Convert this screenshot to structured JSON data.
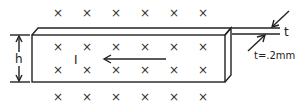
{
  "diagram": {
    "field_symbol": "×",
    "field_grid": {
      "rows": 4,
      "cols": 6
    },
    "labels": {
      "height": "h",
      "current": "I",
      "thickness": "t",
      "thickness_value": "t=.2mm"
    }
  }
}
